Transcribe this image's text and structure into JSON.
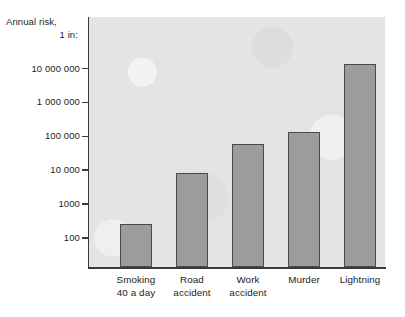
{
  "chart_data": {
    "type": "bar",
    "title": "",
    "subtitle": "",
    "ylabel_line1": "Annual risk,",
    "ylabel_line2": "1 in:",
    "xlabel": "",
    "yscale": "log",
    "ylim": [
      100,
      30000000
    ],
    "grid": false,
    "legend": "none",
    "ytick_labels": [
      "10 000 000",
      "1 000 000",
      "100 000",
      "10 000",
      "1000",
      "100"
    ],
    "ytick_values": [
      10000000,
      1000000,
      100000,
      10000,
      1000,
      100
    ],
    "categories": [
      "Smoking\n40 a day",
      "Road\naccident",
      "Work\naccident",
      "Murder",
      "Lightning"
    ],
    "category_lines": [
      [
        "Smoking",
        "40 a day"
      ],
      [
        "Road",
        "accident"
      ],
      [
        "Work",
        "accident"
      ],
      [
        "Murder",
        ""
      ],
      [
        "Lightning",
        ""
      ]
    ],
    "values": [
      260,
      8000,
      60000,
      130000,
      14000000
    ],
    "colors": {
      "bar_fill": "#9c9c9c",
      "bar_edge": "#4a4a4a",
      "plot_background": "#e4e4e4",
      "axis": "#3a3a3a",
      "text": "#1c1c1c",
      "page_background": "#ffffff"
    }
  }
}
